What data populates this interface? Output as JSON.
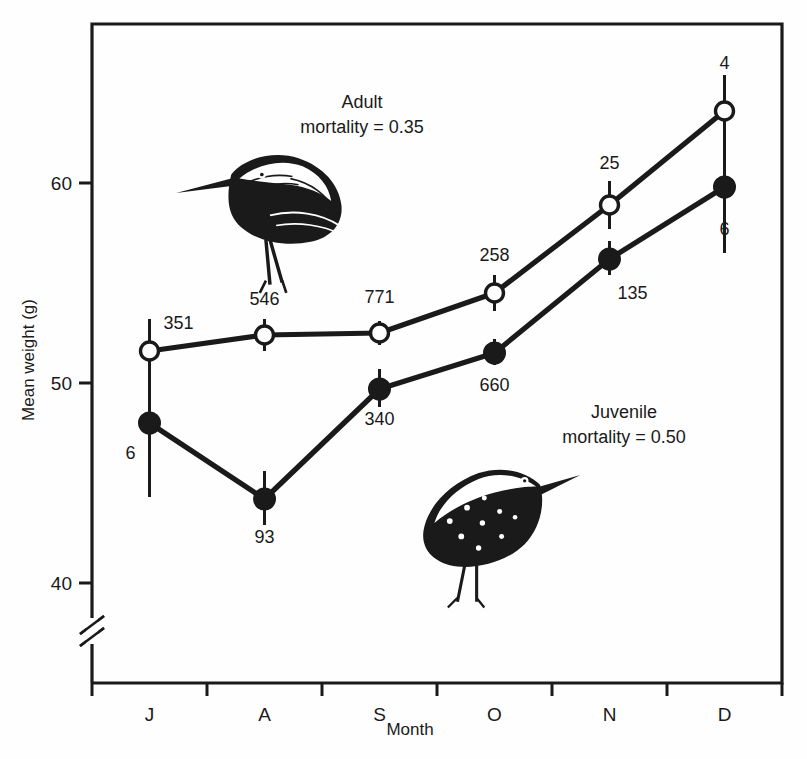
{
  "chart_data": {
    "type": "line",
    "title": "",
    "xlabel": "Month",
    "ylabel": "Mean weight (g)",
    "categories": [
      "J",
      "A",
      "S",
      "O",
      "N",
      "D"
    ],
    "ylim": [
      38.5,
      65.5
    ],
    "yticks": [
      40,
      50,
      60
    ],
    "ytick_labels": [
      "40",
      "50",
      "60"
    ],
    "grid": false,
    "legend": "none",
    "axis_break": true,
    "series": [
      {
        "name": "Adult",
        "marker": "open-circle",
        "values": [
          51.6,
          52.4,
          52.5,
          54.5,
          58.9,
          63.6
        ],
        "sample_sizes": [
          "351",
          "546",
          "771",
          "258",
          "25",
          "4"
        ],
        "error_low": [
          49.8,
          51.6,
          51.9,
          53.6,
          57.7,
          59.8
        ],
        "error_high": [
          53.2,
          53.2,
          53.1,
          55.4,
          60.1,
          65.4
        ]
      },
      {
        "name": "Juvenile",
        "marker": "filled-circle",
        "values": [
          48.0,
          44.2,
          49.7,
          51.5,
          56.2,
          59.8
        ],
        "sample_sizes": [
          "6",
          "93",
          "340",
          "660",
          "135",
          "6"
        ],
        "error_low": [
          44.3,
          42.9,
          48.8,
          50.9,
          55.4,
          56.5
        ],
        "error_high": [
          51.8,
          45.6,
          50.7,
          52.2,
          57.1,
          62.4
        ]
      }
    ],
    "annotations": [
      {
        "name": "adult-annotation",
        "line1": "Adult",
        "line2": "mortality = 0.35"
      },
      {
        "name": "juvenile-annotation",
        "line1": "Juvenile",
        "line2": "mortality = 0.50"
      }
    ],
    "illustrations": [
      {
        "name": "adult-bird-illustration",
        "label": "Adult dunlin in breeding plumage"
      },
      {
        "name": "juvenile-bird-illustration",
        "label": "Juvenile dunlin"
      }
    ],
    "colors": {
      "ink": "#1a1a1a",
      "background": "#fefefe",
      "marker_fill_open": "#ffffff"
    }
  }
}
